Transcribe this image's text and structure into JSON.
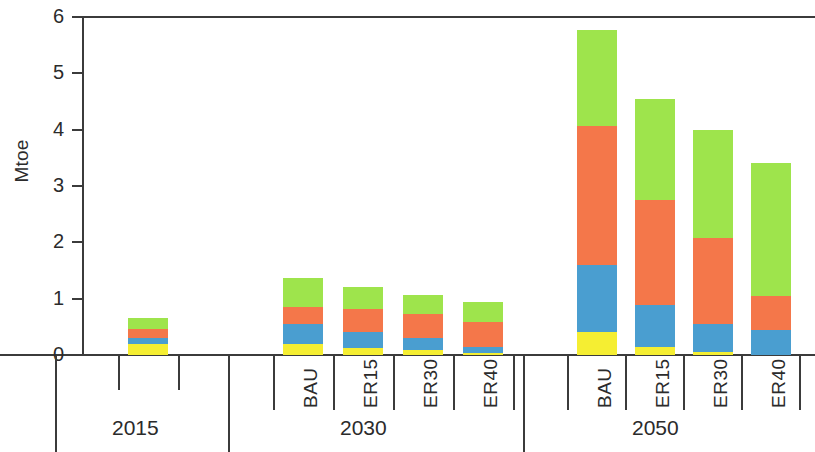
{
  "chart_data": {
    "type": "bar",
    "stacked": true,
    "title": "",
    "subtitle": "",
    "xlabel": "",
    "ylabel": "Mtoe",
    "ylim": [
      0,
      6
    ],
    "ytick_labels": [
      "0",
      "1",
      "2",
      "3",
      "4",
      "5",
      "6"
    ],
    "ytick_values": [
      0,
      1,
      2,
      3,
      4,
      5,
      6
    ],
    "grid": false,
    "legend_position": "none",
    "categories": [
      "2015",
      "2030 BAU",
      "2030 ER15",
      "2030 ER30",
      "2030 ER40",
      "2050 BAU",
      "2050 ER15",
      "2050 ER30",
      "2050 ER40"
    ],
    "group_labels": [
      "2015",
      "2030",
      "2050"
    ],
    "scenario_labels": [
      "BAU",
      "ER15",
      "ER30",
      "ER40"
    ],
    "series": [
      {
        "name": "yellow-segment",
        "color": "#f5ee32",
        "values": [
          0.2,
          0.19,
          0.13,
          0.09,
          0.04,
          0.41,
          0.14,
          0.05,
          0.0
        ]
      },
      {
        "name": "blue-segment",
        "color": "#4a9ed0",
        "values": [
          0.11,
          0.36,
          0.27,
          0.21,
          0.11,
          1.18,
          0.75,
          0.5,
          0.45
        ]
      },
      {
        "name": "orange-segment",
        "color": "#f4774a",
        "values": [
          0.15,
          0.3,
          0.41,
          0.42,
          0.44,
          2.47,
          1.87,
          1.53,
          0.6
        ]
      },
      {
        "name": "green-segment",
        "color": "#9ee44c",
        "values": [
          0.19,
          0.52,
          0.4,
          0.35,
          0.36,
          1.71,
          1.79,
          1.92,
          2.35
        ]
      }
    ],
    "totals": [
      0.65,
      1.37,
      1.21,
      1.07,
      0.95,
      5.77,
      4.55,
      4.0,
      3.4
    ]
  },
  "axis": {
    "y_label": "Mtoe"
  },
  "colors": {
    "yellow": "#f5ee32",
    "blue": "#4a9ed0",
    "orange": "#f4774a",
    "green": "#9ee44c",
    "axis": "#3b3b3b",
    "text": "#2b2b2b"
  }
}
